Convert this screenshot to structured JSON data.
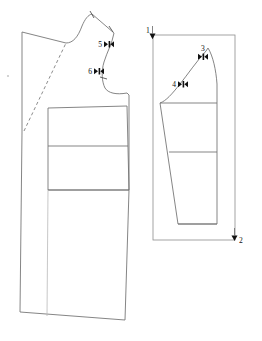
{
  "diagram": {
    "type": "technical-sewing-pattern",
    "background_color": "#ffffff",
    "line_color": "#6f6f6f",
    "marker_color": "#111111",
    "panels": [
      {
        "id": "left-panel",
        "name": "front-bodice-block",
        "labels": []
      },
      {
        "id": "right-panel",
        "name": "sleeve-cap-block",
        "frame": true,
        "labels": []
      }
    ],
    "annotations": [
      {
        "id": "a1",
        "text": "1",
        "x": 146,
        "y": 32,
        "marker": "down-triangle",
        "panel": "right-panel"
      },
      {
        "id": "a2",
        "text": "2",
        "x": 239,
        "y": 241,
        "marker": "down-triangle",
        "panel": "right-panel"
      },
      {
        "id": "a3",
        "text": "3",
        "x": 203,
        "y": 52,
        "marker": "double-arrow",
        "panel": "right-panel"
      },
      {
        "id": "a4",
        "text": "4",
        "x": 178,
        "y": 84,
        "marker": "double-arrow",
        "panel": "right-panel"
      },
      {
        "id": "a5",
        "text": "5",
        "x": 105,
        "y": 44,
        "marker": "double-arrow",
        "panel": "left-panel"
      },
      {
        "id": "a6",
        "text": "6",
        "x": 95,
        "y": 71,
        "marker": "double-arrow",
        "panel": "left-panel"
      }
    ],
    "notches": [
      {
        "id": "n-shoulder-left",
        "panel": "left-panel"
      },
      {
        "id": "n-shoulder-right",
        "panel": "left-panel"
      },
      {
        "id": "n-armhole",
        "panel": "left-panel"
      }
    ]
  }
}
